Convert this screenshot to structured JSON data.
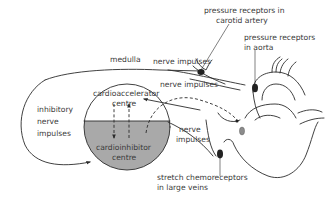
{
  "colors": {
    "ink": "#2b2b2b",
    "text": "#3a3a3a",
    "inhibitor_fill": "#a9a9a9",
    "receptor_fill": "#222222",
    "ganglion_fill": "#8c8c8c",
    "background": "#ffffff"
  },
  "labels": {
    "medulla": "medulla",
    "nerve_impulses_top": "nerve impulses",
    "nerve_impulses_mid": "nerve impulses",
    "nerve_impulses_low_1": "nerve",
    "nerve_impulses_low_2": "impulses",
    "inhibitory_1": "inhibitory",
    "inhibitory_2": "nerve",
    "inhibitory_3": "impulses",
    "cardioaccelerator_1": "cardioaccelerator",
    "cardioaccelerator_2": "centre",
    "cardioinhibitor_1": "cardioinhibitor",
    "cardioinhibitor_2": "centre",
    "carotid_1": "pressure receptors in",
    "carotid_2": "carotid artery",
    "aorta_1": "pressure receptors",
    "aorta_2": "in aorta",
    "veins_1": "stretch chemoreceptors",
    "veins_2": "in large veins"
  }
}
